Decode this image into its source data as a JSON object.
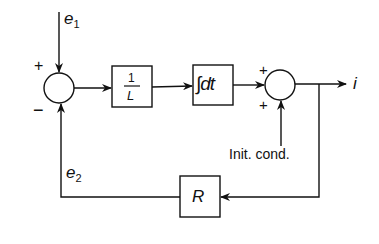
{
  "diagram": {
    "type": "block-diagram",
    "inputs": {
      "e1": "e",
      "e1_sub": "1",
      "e2": "e",
      "e2_sub": "2"
    },
    "summing_junction_1": {
      "plus": "+",
      "minus": "−"
    },
    "summing_junction_2": {
      "plus_top": "+",
      "plus_bottom": "+"
    },
    "blocks": {
      "inverse_L": {
        "numerator": "1",
        "denominator": "L"
      },
      "integrator": {
        "label": "∫dt"
      },
      "resistor": {
        "label": "R"
      }
    },
    "output": {
      "label": "i"
    },
    "initial_condition": {
      "label": "Init. cond."
    },
    "colors": {
      "stroke": "#111111",
      "background": "#ffffff"
    }
  }
}
